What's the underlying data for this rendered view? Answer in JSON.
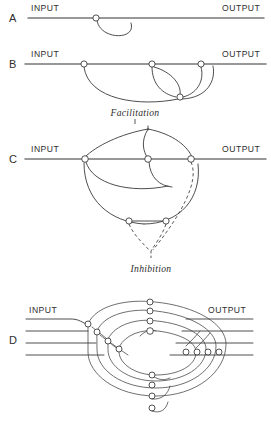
{
  "figure": {
    "background_color": "#ffffff",
    "ink_color": "#333333",
    "panels": [
      {
        "letter": "A",
        "input_label": "INPUT",
        "output_label": "OUTPUT",
        "caption": "",
        "synapse_count": 1,
        "description": "single pathway with one synapse and a short recurrent loop"
      },
      {
        "letter": "B",
        "input_label": "INPUT",
        "output_label": "OUTPUT",
        "caption": "Facilitation",
        "synapse_count": 4,
        "description": "pathway with three inline synapses and positive feedback loops"
      },
      {
        "letter": "C",
        "input_label": "INPUT",
        "output_label": "OUTPUT",
        "caption": "Inhibition",
        "synapse_count": 5,
        "description": "pathway with collaterals converging through dashed inhibitory branches"
      },
      {
        "letter": "D",
        "input_label": "INPUT",
        "output_label": "OUTPUT",
        "caption": "",
        "synapse_count": 20,
        "description": "multi-channel reverberating network of nested closed loops"
      }
    ],
    "line_styles": {
      "solid": "excitatory connection",
      "dashed": "inhibitory connection"
    }
  }
}
